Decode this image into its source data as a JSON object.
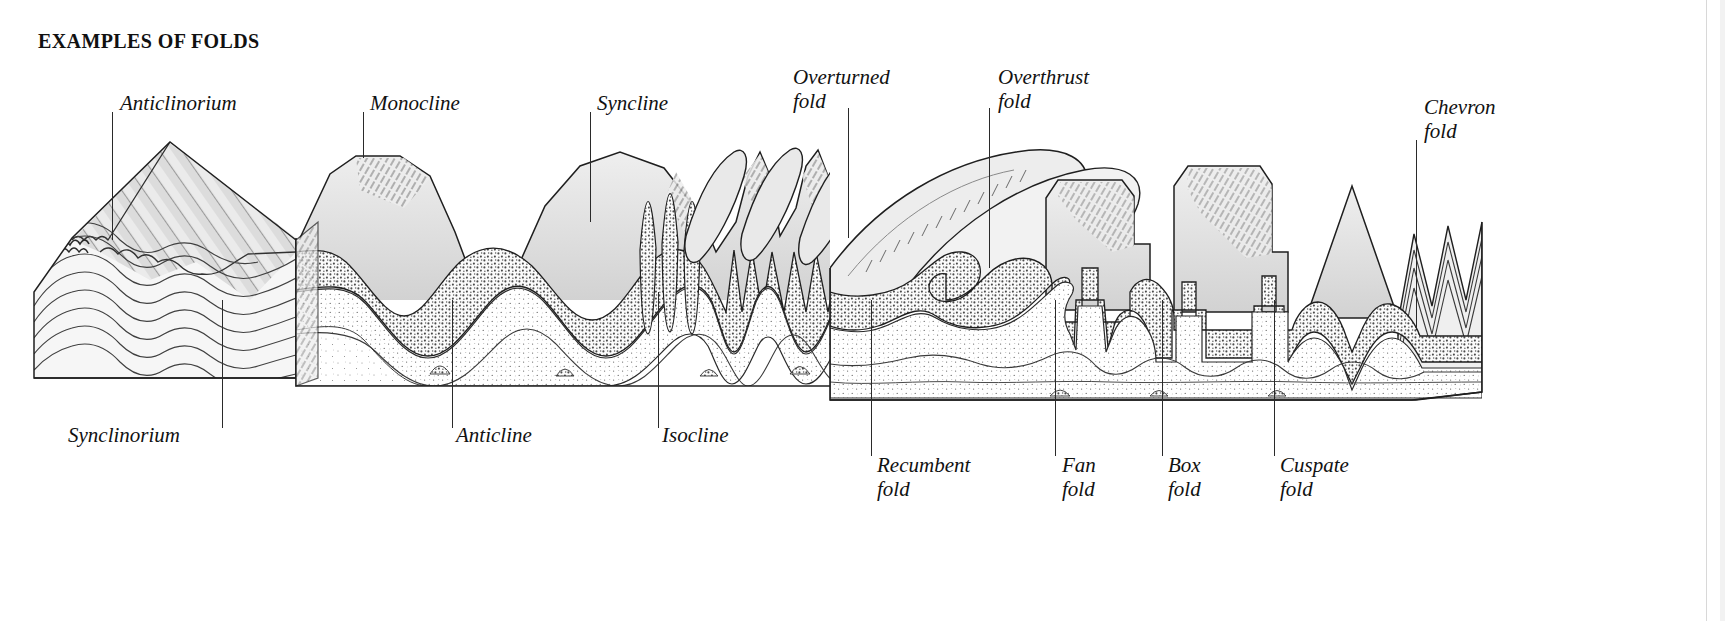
{
  "title": "EXAMPLES OF FOLDS",
  "colors": {
    "ink": "#1a1a1a",
    "line": "#2a2a2a",
    "rock_top": "#e3e3e3",
    "rock_shade": "#d7d7d7",
    "stipple_dark": "#c9c9c9",
    "stipple_light": "#efefef",
    "paper": "#ffffff"
  },
  "labels_top": [
    {
      "id": "anticlinorium",
      "text": "Anticlinorium",
      "x": 120,
      "y": 92,
      "leader_x": 112,
      "leader_y1": 112,
      "leader_y2": 240
    },
    {
      "id": "monocline",
      "text": "Monocline",
      "x": 370,
      "y": 92,
      "leader_x": 363,
      "leader_y1": 112,
      "leader_y2": 158
    },
    {
      "id": "syncline",
      "text": "Syncline",
      "x": 597,
      "y": 92,
      "leader_x": 590,
      "leader_y1": 112,
      "leader_y2": 222
    },
    {
      "id": "overturned-fold",
      "text": "Overturned\nfold",
      "x": 793,
      "y": 66,
      "leader_x": 848,
      "leader_y1": 108,
      "leader_y2": 238
    },
    {
      "id": "overthrust-fold",
      "text": "Overthrust\nfold",
      "x": 998,
      "y": 66,
      "leader_x": 989,
      "leader_y1": 108,
      "leader_y2": 268
    },
    {
      "id": "chevron-fold",
      "text": "Chevron\nfold",
      "x": 1424,
      "y": 96,
      "leader_x": 1416,
      "leader_y1": 140,
      "leader_y2": 330
    }
  ],
  "labels_bottom": [
    {
      "id": "synclinorium",
      "text": "Synclinorium",
      "x": 68,
      "y": 424,
      "leader_x": 222,
      "leader_y1": 300,
      "leader_y2": 428
    },
    {
      "id": "anticline",
      "text": "Anticline",
      "x": 456,
      "y": 424,
      "leader_x": 452,
      "leader_y1": 300,
      "leader_y2": 428
    },
    {
      "id": "isocline",
      "text": "Isocline",
      "x": 662,
      "y": 424,
      "leader_x": 658,
      "leader_y1": 292,
      "leader_y2": 428
    },
    {
      "id": "recumbent-fold",
      "text": "Recumbent\nfold",
      "x": 877,
      "y": 454,
      "leader_x": 871,
      "leader_y1": 300,
      "leader_y2": 456
    },
    {
      "id": "fan-fold",
      "text": "Fan\nfold",
      "x": 1062,
      "y": 454,
      "leader_x": 1055,
      "leader_y1": 300,
      "leader_y2": 456
    },
    {
      "id": "box-fold",
      "text": "Box\nfold",
      "x": 1168,
      "y": 454,
      "leader_x": 1162,
      "leader_y1": 300,
      "leader_y2": 456
    },
    {
      "id": "cuspate-fold",
      "text": "Cuspate\nfold",
      "x": 1280,
      "y": 454,
      "leader_x": 1274,
      "leader_y1": 300,
      "leader_y2": 456
    }
  ],
  "diagram": {
    "blocks": [
      {
        "name": "left-block",
        "x": 34,
        "width": 262
      },
      {
        "name": "center-block",
        "x": 296,
        "width": 560
      },
      {
        "name": "right-block",
        "x": 830,
        "width": 650
      }
    ],
    "strata_layer_names": [
      "upper-light-bed",
      "stippled-dark-bed",
      "mid-light-bed",
      "lower-stippled-bed",
      "basal-bed"
    ]
  }
}
